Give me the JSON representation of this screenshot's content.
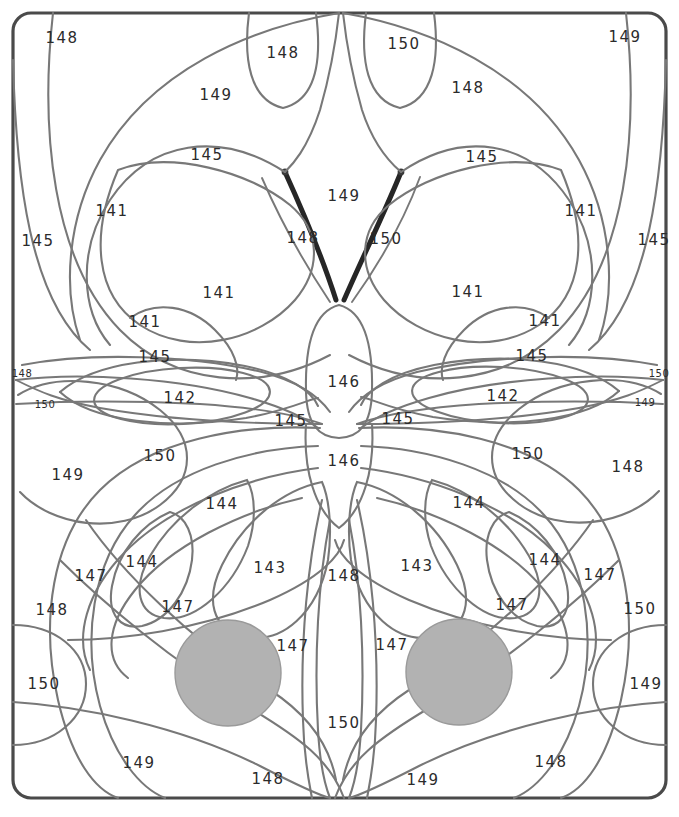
{
  "page": {
    "clipped_header_text": "",
    "width": 679,
    "height": 817
  },
  "style": {
    "background": "#ffffff",
    "frame_color": "#4a4a4a",
    "line_color": "#787878",
    "accent_line_color": "#262626",
    "shape_fill": "#b2b2b2",
    "label_color": "#2b2b2b"
  },
  "chart_data": {
    "type": "diagram",
    "legend": [],
    "region_labels": [
      {
        "value": "148",
        "x": 62,
        "y": 38,
        "size": "normal"
      },
      {
        "value": "148",
        "x": 283,
        "y": 53,
        "size": "normal"
      },
      {
        "value": "150",
        "x": 404,
        "y": 44,
        "size": "normal"
      },
      {
        "value": "149",
        "x": 625,
        "y": 37,
        "size": "normal"
      },
      {
        "value": "149",
        "x": 216,
        "y": 95,
        "size": "normal"
      },
      {
        "value": "148",
        "x": 468,
        "y": 88,
        "size": "normal"
      },
      {
        "value": "145",
        "x": 207,
        "y": 155,
        "size": "normal"
      },
      {
        "value": "145",
        "x": 482,
        "y": 157,
        "size": "normal"
      },
      {
        "value": "149",
        "x": 344,
        "y": 196,
        "size": "normal"
      },
      {
        "value": "141",
        "x": 112,
        "y": 211,
        "size": "normal"
      },
      {
        "value": "141",
        "x": 581,
        "y": 211,
        "size": "normal"
      },
      {
        "value": "145",
        "x": 38,
        "y": 241,
        "size": "normal"
      },
      {
        "value": "145",
        "x": 654,
        "y": 240,
        "size": "normal"
      },
      {
        "value": "148",
        "x": 303,
        "y": 238,
        "size": "normal"
      },
      {
        "value": "150",
        "x": 386,
        "y": 239,
        "size": "normal"
      },
      {
        "value": "141",
        "x": 219,
        "y": 293,
        "size": "normal"
      },
      {
        "value": "141",
        "x": 468,
        "y": 292,
        "size": "normal"
      },
      {
        "value": "141",
        "x": 145,
        "y": 322,
        "size": "normal"
      },
      {
        "value": "141",
        "x": 545,
        "y": 321,
        "size": "normal"
      },
      {
        "value": "145",
        "x": 155,
        "y": 357,
        "size": "normal"
      },
      {
        "value": "145",
        "x": 532,
        "y": 356,
        "size": "normal"
      },
      {
        "value": "148",
        "x": 22,
        "y": 374,
        "size": "small"
      },
      {
        "value": "150",
        "x": 659,
        "y": 374,
        "size": "small"
      },
      {
        "value": "150",
        "x": 45,
        "y": 405,
        "size": "small"
      },
      {
        "value": "149",
        "x": 645,
        "y": 403,
        "size": "small"
      },
      {
        "value": "142",
        "x": 180,
        "y": 398,
        "size": "normal"
      },
      {
        "value": "142",
        "x": 503,
        "y": 396,
        "size": "normal"
      },
      {
        "value": "146",
        "x": 344,
        "y": 382,
        "size": "normal"
      },
      {
        "value": "145",
        "x": 291,
        "y": 421,
        "size": "normal"
      },
      {
        "value": "145",
        "x": 398,
        "y": 419,
        "size": "normal"
      },
      {
        "value": "150",
        "x": 160,
        "y": 456,
        "size": "normal"
      },
      {
        "value": "150",
        "x": 528,
        "y": 454,
        "size": "normal"
      },
      {
        "value": "149",
        "x": 68,
        "y": 475,
        "size": "normal"
      },
      {
        "value": "148",
        "x": 628,
        "y": 467,
        "size": "normal"
      },
      {
        "value": "146",
        "x": 344,
        "y": 461,
        "size": "normal"
      },
      {
        "value": "144",
        "x": 222,
        "y": 504,
        "size": "normal"
      },
      {
        "value": "144",
        "x": 469,
        "y": 503,
        "size": "normal"
      },
      {
        "value": "144",
        "x": 142,
        "y": 562,
        "size": "normal"
      },
      {
        "value": "144",
        "x": 545,
        "y": 560,
        "size": "normal"
      },
      {
        "value": "143",
        "x": 270,
        "y": 568,
        "size": "normal"
      },
      {
        "value": "143",
        "x": 417,
        "y": 566,
        "size": "normal"
      },
      {
        "value": "148",
        "x": 344,
        "y": 576,
        "size": "normal"
      },
      {
        "value": "147",
        "x": 91,
        "y": 576,
        "size": "normal"
      },
      {
        "value": "147",
        "x": 600,
        "y": 575,
        "size": "normal"
      },
      {
        "value": "147",
        "x": 178,
        "y": 607,
        "size": "normal"
      },
      {
        "value": "147",
        "x": 512,
        "y": 605,
        "size": "normal"
      },
      {
        "value": "148",
        "x": 52,
        "y": 610,
        "size": "normal"
      },
      {
        "value": "150",
        "x": 640,
        "y": 609,
        "size": "normal"
      },
      {
        "value": "147",
        "x": 293,
        "y": 646,
        "size": "normal"
      },
      {
        "value": "147",
        "x": 392,
        "y": 645,
        "size": "normal"
      },
      {
        "value": "150",
        "x": 44,
        "y": 684,
        "size": "normal"
      },
      {
        "value": "149",
        "x": 646,
        "y": 684,
        "size": "normal"
      },
      {
        "value": "150",
        "x": 344,
        "y": 723,
        "size": "normal"
      },
      {
        "value": "149",
        "x": 139,
        "y": 763,
        "size": "normal"
      },
      {
        "value": "148",
        "x": 551,
        "y": 762,
        "size": "normal"
      },
      {
        "value": "148",
        "x": 268,
        "y": 779,
        "size": "normal"
      },
      {
        "value": "149",
        "x": 423,
        "y": 780,
        "size": "normal"
      }
    ],
    "filled_shapes": [
      {
        "name": "left-spot",
        "cx": 228,
        "cy": 673,
        "r": 53,
        "fill": "#b2b2b2"
      },
      {
        "name": "right-spot",
        "cx": 459,
        "cy": 672,
        "r": 53,
        "fill": "#b2b2b2"
      }
    ],
    "frame": {
      "x": 13,
      "y": 13,
      "width": 653,
      "height": 785,
      "radius": 18
    }
  }
}
